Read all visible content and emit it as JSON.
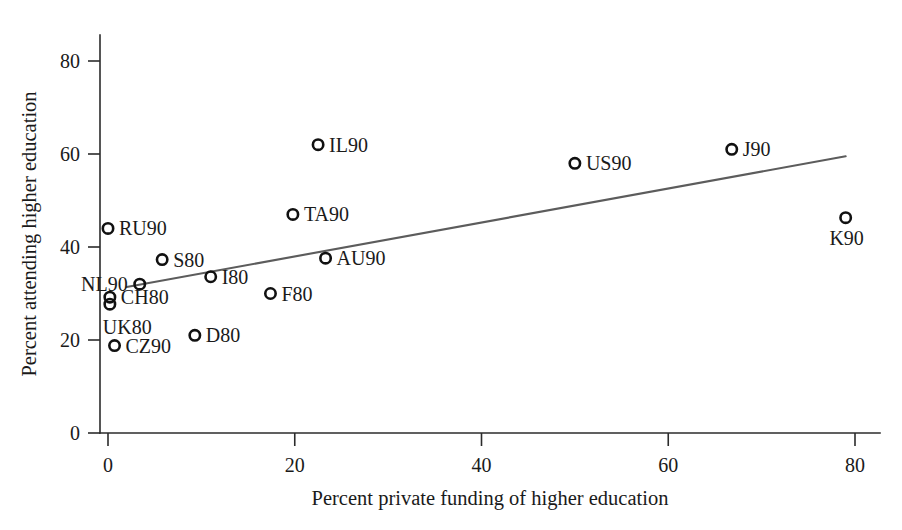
{
  "chart_data": {
    "type": "scatter",
    "title": "",
    "xlabel": "Percent private funding of higher education",
    "ylabel": "Percent attending higher education",
    "xlim": [
      -4,
      86
    ],
    "ylim": [
      0,
      88
    ],
    "xticks": [
      0,
      20,
      40,
      60,
      80
    ],
    "yticks": [
      0,
      20,
      40,
      60,
      80
    ],
    "xtick_labels": [
      "0",
      "20",
      "40",
      "60",
      "80"
    ],
    "ytick_labels": [
      "0",
      "20",
      "40",
      "60",
      "80"
    ],
    "grid": false,
    "legend": "none",
    "points": [
      {
        "label": "RU90",
        "x": 0.0,
        "y": 44.0,
        "label_pos": "right"
      },
      {
        "label": "NL90",
        "x": 3.4,
        "y": 32.0,
        "label_pos": "left"
      },
      {
        "label": "S80",
        "x": 5.8,
        "y": 37.3,
        "label_pos": "right"
      },
      {
        "label": "CH80",
        "x": 0.2,
        "y": 29.2,
        "label_pos": "right"
      },
      {
        "label": "UK80",
        "x": 0.2,
        "y": 27.7,
        "label_pos": "below-left"
      },
      {
        "label": "CZ90",
        "x": 0.7,
        "y": 18.8,
        "label_pos": "right"
      },
      {
        "label": "D80",
        "x": 9.3,
        "y": 21.0,
        "label_pos": "right"
      },
      {
        "label": "I80",
        "x": 11.0,
        "y": 33.6,
        "label_pos": "right"
      },
      {
        "label": "F80",
        "x": 17.4,
        "y": 30.0,
        "label_pos": "right"
      },
      {
        "label": "TA90",
        "x": 19.8,
        "y": 47.0,
        "label_pos": "right"
      },
      {
        "label": "IL90",
        "x": 22.5,
        "y": 62.0,
        "label_pos": "right"
      },
      {
        "label": "AU90",
        "x": 23.3,
        "y": 37.6,
        "label_pos": "right"
      },
      {
        "label": "US90",
        "x": 50.0,
        "y": 58.0,
        "label_pos": "right"
      },
      {
        "label": "J90",
        "x": 66.8,
        "y": 61.0,
        "label_pos": "right"
      },
      {
        "label": "K90",
        "x": 79.0,
        "y": 46.3,
        "label_pos": "below"
      }
    ],
    "trend_line": {
      "x_start": 2.0,
      "y_start": 31.4,
      "x_end": 79.0,
      "y_end": 59.5
    }
  }
}
